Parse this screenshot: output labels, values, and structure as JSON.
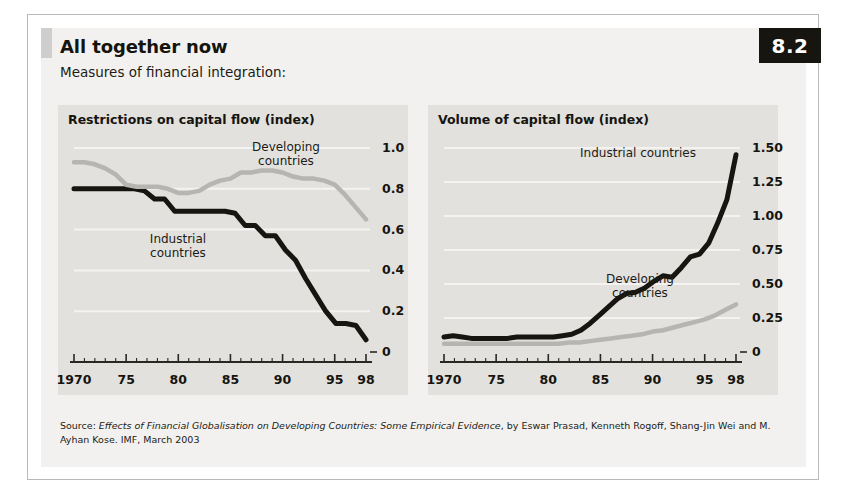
{
  "badge": "8.2",
  "title": "All together now",
  "subtitle": "Measures of financial integration:",
  "source": {
    "prefix": "Source: ",
    "italic_title": "Effects of Financial Globalisation on Developing Countries: Some Empirical Evidence",
    "rest": ", by Eswar Prasad, Kenneth Rogoff, Shang-Jin Wei and M. Ayhan Kose. IMF, March 2003"
  },
  "colors": {
    "industrial": "#17150f",
    "developing": "#b6b5b2",
    "panel_bg": "#e2e1de",
    "card_bg": "#f2f1ef",
    "axis": "#2a2822",
    "gridline": "#f4f3f1",
    "badge_bg": "#17150f"
  },
  "chart_data": [
    {
      "type": "line",
      "id": "restrictions",
      "title": "Restrictions on capital flow (index)",
      "xlabel": "",
      "ylabel": "index",
      "xlim": [
        1970,
        1998
      ],
      "ylim": [
        0,
        1.0
      ],
      "grid": true,
      "legend_position": "inline-annotations",
      "yticks": [
        "1.0",
        "0.8",
        "0.6",
        "0.4",
        "0.2",
        "0"
      ],
      "ytick_values": [
        1.0,
        0.8,
        0.6,
        0.4,
        0.2,
        0
      ],
      "xticks": [
        "1970",
        "75",
        "80",
        "85",
        "90",
        "95",
        "98"
      ],
      "xtick_values": [
        1970,
        1975,
        1980,
        1985,
        1990,
        1995,
        1998
      ],
      "x": [
        1970,
        1971,
        1972,
        1973,
        1974,
        1975,
        1976,
        1977,
        1978,
        1979,
        1980,
        1981,
        1982,
        1983,
        1984,
        1985,
        1986,
        1987,
        1988,
        1989,
        1990,
        1991,
        1992,
        1993,
        1994,
        1995,
        1996,
        1997,
        1998
      ],
      "series": [
        {
          "name": "Industrial countries",
          "color": "#17150f",
          "label_lines": [
            "Industrial",
            "countries"
          ],
          "values": [
            0.8,
            0.8,
            0.8,
            0.8,
            0.8,
            0.8,
            0.8,
            0.79,
            0.75,
            0.75,
            0.69,
            0.69,
            0.69,
            0.69,
            0.69,
            0.69,
            0.68,
            0.62,
            0.62,
            0.57,
            0.57,
            0.5,
            0.45,
            0.36,
            0.28,
            0.2,
            0.14,
            0.14,
            0.13,
            0.06
          ]
        },
        {
          "name": "Developing countries",
          "color": "#b6b5b2",
          "label_lines": [
            "Developing",
            "countries"
          ],
          "values": [
            0.93,
            0.93,
            0.92,
            0.9,
            0.87,
            0.82,
            0.81,
            0.81,
            0.81,
            0.8,
            0.78,
            0.78,
            0.79,
            0.82,
            0.84,
            0.85,
            0.88,
            0.88,
            0.89,
            0.89,
            0.88,
            0.86,
            0.85,
            0.85,
            0.84,
            0.82,
            0.77,
            0.71,
            0.65
          ]
        }
      ]
    },
    {
      "type": "line",
      "id": "volume",
      "title": "Volume of capital flow (index)",
      "xlabel": "",
      "ylabel": "index",
      "xlim": [
        1970,
        1998
      ],
      "ylim": [
        0,
        1.5
      ],
      "grid": true,
      "legend_position": "inline-annotations",
      "yticks": [
        "1.50",
        "1.25",
        "1.00",
        "0.75",
        "0.50",
        "0.25",
        "0"
      ],
      "ytick_values": [
        1.5,
        1.25,
        1.0,
        0.75,
        0.5,
        0.25,
        0
      ],
      "xticks": [
        "1970",
        "75",
        "80",
        "85",
        "90",
        "95",
        "98"
      ],
      "xtick_values": [
        1970,
        1975,
        1980,
        1985,
        1990,
        1995,
        1998
      ],
      "x": [
        1970,
        1971,
        1972,
        1973,
        1974,
        1975,
        1976,
        1977,
        1978,
        1979,
        1980,
        1981,
        1982,
        1983,
        1984,
        1985,
        1986,
        1987,
        1988,
        1989,
        1990,
        1991,
        1992,
        1993,
        1994,
        1995,
        1996,
        1997,
        1998
      ],
      "series": [
        {
          "name": "Industrial countries",
          "color": "#17150f",
          "label_lines": [
            "Industrial countries"
          ],
          "values": [
            0.11,
            0.12,
            0.11,
            0.1,
            0.1,
            0.1,
            0.1,
            0.1,
            0.11,
            0.11,
            0.11,
            0.11,
            0.11,
            0.12,
            0.13,
            0.16,
            0.21,
            0.27,
            0.33,
            0.39,
            0.43,
            0.44,
            0.47,
            0.52,
            0.56,
            0.55,
            0.62,
            0.7,
            0.72,
            0.8,
            0.95,
            1.12,
            1.45
          ]
        },
        {
          "name": "Developing countries",
          "color": "#b6b5b2",
          "label_lines": [
            "Developing",
            "countries"
          ],
          "values": [
            0.06,
            0.06,
            0.06,
            0.06,
            0.06,
            0.06,
            0.06,
            0.06,
            0.06,
            0.06,
            0.06,
            0.06,
            0.07,
            0.07,
            0.08,
            0.09,
            0.1,
            0.11,
            0.12,
            0.13,
            0.15,
            0.16,
            0.18,
            0.2,
            0.22,
            0.24,
            0.27,
            0.31,
            0.35
          ]
        }
      ]
    }
  ]
}
